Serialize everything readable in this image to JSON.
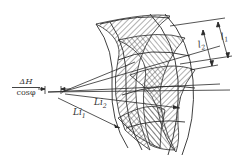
{
  "figure": {
    "type": "engineering-diagram",
    "labels": {
      "delta_h_numerator": "ΔH",
      "delta_h_denominator": "cosφ",
      "l1": "l",
      "l1_sub": "1",
      "l2": "l",
      "l2_sub": "2",
      "li1": "Li",
      "li1_sub": "1",
      "li2": "Li",
      "li2_sub": "2"
    },
    "colors": {
      "line": "#2a2a2a",
      "hatch": "#3a3a3a",
      "background": "#ffffff"
    }
  }
}
